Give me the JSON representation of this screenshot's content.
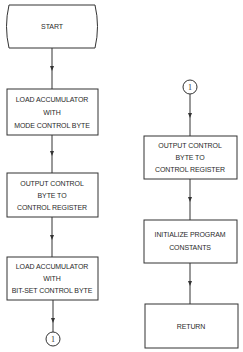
{
  "diagram": {
    "type": "flowchart",
    "left_column": {
      "start": {
        "label": "START"
      },
      "steps": [
        {
          "lines": [
            "LOAD ACCUMULATOR",
            "WITH",
            "MODE CONTROL BYTE"
          ]
        },
        {
          "lines": [
            "OUTPUT CONTROL",
            "BYTE TO",
            "CONTROL REGISTER"
          ]
        },
        {
          "lines": [
            "LOAD ACCUMULATOR",
            "WITH",
            "BIT-SET CONTROL BYTE"
          ]
        }
      ],
      "off_page_connector": {
        "label": "1"
      }
    },
    "right_column": {
      "on_page_connector": {
        "label": "1"
      },
      "steps": [
        {
          "lines": [
            "OUTPUT CONTROL",
            "BYTE TO",
            "CONTROL REGISTER"
          ]
        },
        {
          "lines": [
            "INITIALIZE PROGRAM",
            "CONSTANTS"
          ]
        },
        {
          "lines": [
            "RETURN"
          ]
        }
      ]
    }
  }
}
